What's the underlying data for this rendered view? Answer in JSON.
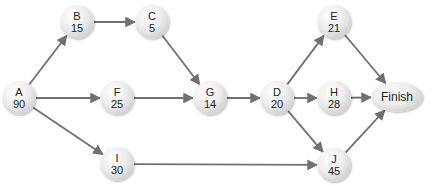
{
  "diagram": {
    "type": "activity-on-node network",
    "edge_color": "#707070",
    "nodes": [
      {
        "id": "A",
        "label": "A",
        "duration": "90",
        "x": 19,
        "y": 98
      },
      {
        "id": "B",
        "label": "B",
        "duration": "15",
        "x": 77,
        "y": 22
      },
      {
        "id": "C",
        "label": "C",
        "duration": "5",
        "x": 152,
        "y": 22
      },
      {
        "id": "F",
        "label": "F",
        "duration": "25",
        "x": 117,
        "y": 98
      },
      {
        "id": "I",
        "label": "I",
        "duration": "30",
        "x": 117,
        "y": 164
      },
      {
        "id": "G",
        "label": "G",
        "duration": "14",
        "x": 210,
        "y": 98
      },
      {
        "id": "D",
        "label": "D",
        "duration": "20",
        "x": 277,
        "y": 98
      },
      {
        "id": "E",
        "label": "E",
        "duration": "21",
        "x": 334,
        "y": 22
      },
      {
        "id": "H",
        "label": "H",
        "duration": "28",
        "x": 334,
        "y": 98
      },
      {
        "id": "J",
        "label": "J",
        "duration": "45",
        "x": 334,
        "y": 165
      }
    ],
    "finish": {
      "label": "Finish",
      "x": 397,
      "y": 97
    },
    "edges": [
      [
        "A",
        "B"
      ],
      [
        "A",
        "F"
      ],
      [
        "A",
        "I"
      ],
      [
        "B",
        "C"
      ],
      [
        "C",
        "G"
      ],
      [
        "F",
        "G"
      ],
      [
        "G",
        "D"
      ],
      [
        "D",
        "E"
      ],
      [
        "D",
        "H"
      ],
      [
        "D",
        "J"
      ],
      [
        "I",
        "J"
      ],
      [
        "E",
        "Finish"
      ],
      [
        "H",
        "Finish"
      ],
      [
        "J",
        "Finish"
      ]
    ]
  }
}
